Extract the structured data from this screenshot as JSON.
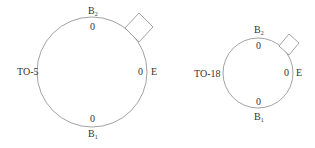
{
  "diagrams": [
    {
      "package": "TO-5",
      "labels": {
        "top_pin": "B",
        "top_pin_sub": "2",
        "bottom_pin": "B",
        "bottom_pin_sub": "1",
        "right_pin": "E",
        "top_value": "0",
        "bottom_value": "0",
        "right_value": "0"
      },
      "tab": "square-tab"
    },
    {
      "package": "TO-18",
      "labels": {
        "top_pin": "B",
        "top_pin_sub": "2",
        "bottom_pin": "B",
        "bottom_pin_sub": "1",
        "right_pin": "E",
        "top_value": "0",
        "bottom_value": "0",
        "right_value": "0"
      },
      "tab": "square-tab"
    }
  ],
  "colors": {
    "stroke": "#8a8a8a",
    "text": "#333333",
    "background": "#ffffff"
  }
}
